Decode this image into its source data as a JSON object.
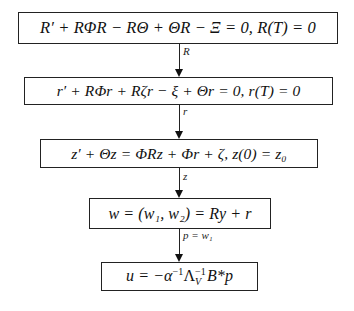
{
  "diagram": {
    "type": "flowchart",
    "direction": "top-to-bottom",
    "nodes": [
      {
        "id": "riccati",
        "label": "R′ + RΦR − RΘ + ΘR − Ξ = 0, R(T) = 0"
      },
      {
        "id": "adjoint-r",
        "label": "r′ + RΦr + Rζr − ξ + Θr = 0, r(T) = 0"
      },
      {
        "id": "state-z",
        "label": "z′ + Θz = ΦRz + Φr + ζ, z(0) = z₀"
      },
      {
        "id": "w-def",
        "label": "w = (w₁, w₂) = Ry + r"
      },
      {
        "id": "control-u",
        "label": "u = −α⁻¹Λ_V⁻¹B*p",
        "parts": {
          "lhs": "u = −α",
          "sup1": "−1",
          "lambda": "Λ",
          "sup2": "−1",
          "sub2": "V",
          "tail": "B*p"
        }
      }
    ],
    "edges": [
      {
        "from": "riccati",
        "to": "adjoint-r",
        "label": "R"
      },
      {
        "from": "adjoint-r",
        "to": "state-z",
        "label": "r"
      },
      {
        "from": "state-z",
        "to": "w-def",
        "label": "z"
      },
      {
        "from": "w-def",
        "to": "control-u",
        "label": "p = w₁"
      }
    ]
  }
}
